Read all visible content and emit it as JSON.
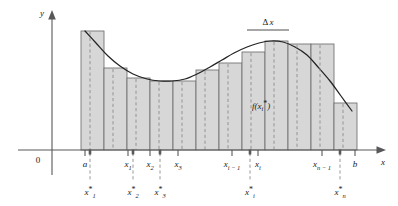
{
  "figure": {
    "axes": {
      "y_label": "y",
      "x_label": "x",
      "origin_label": "0"
    },
    "annotations": {
      "delta_x": "Δx",
      "delta_x_plain": "Δ",
      "delta_x_var": "x",
      "function_value": "f(x",
      "function_value_sub": "i",
      "function_value_star": "*",
      "function_value_close": ")"
    },
    "colors": {
      "bar_fill": "#d7d7d7",
      "bar_stroke": "#6d6d6d",
      "curve": "#232323",
      "axis": "#58585a",
      "dash": "#8c8c8c",
      "background": "#ffffff"
    },
    "partition_labels": [
      {
        "name": "a",
        "base": "a",
        "sub": "",
        "star": false,
        "x": 85
      },
      {
        "name": "x1",
        "base": "x",
        "sub": "1",
        "star": false,
        "x": 128
      },
      {
        "name": "x2",
        "base": "x",
        "sub": "2",
        "star": false,
        "x": 150
      },
      {
        "name": "x3",
        "base": "x",
        "sub": "3",
        "star": false,
        "x": 178
      },
      {
        "name": "xi-1",
        "base": "x",
        "sub": "i − 1",
        "star": false,
        "x": 232
      },
      {
        "name": "xi",
        "base": "x",
        "sub": "i",
        "star": false,
        "x": 258
      },
      {
        "name": "xn-1",
        "base": "x",
        "sub": "n − 1",
        "star": false,
        "x": 322
      },
      {
        "name": "b",
        "base": "b",
        "sub": "",
        "star": false,
        "x": 355
      }
    ],
    "sample_labels": [
      {
        "name": "x1-star",
        "base": "x",
        "sub": "1",
        "star": true,
        "x": 90
      },
      {
        "name": "x2-star",
        "base": "x",
        "sub": "2",
        "star": true,
        "x": 133
      },
      {
        "name": "x3-star",
        "base": "x",
        "sub": "3",
        "star": true,
        "x": 160
      },
      {
        "name": "xi-star",
        "base": "x",
        "sub": "i",
        "star": true,
        "x": 250
      },
      {
        "name": "xn-star",
        "base": "x",
        "sub": "n",
        "star": true,
        "x": 340
      }
    ]
  },
  "chart_data": {
    "type": "area",
    "xlabel": "x",
    "ylabel": "y",
    "grid": false,
    "legend": null,
    "xlim": [
      0,
      398
    ],
    "ylim": [
      0,
      206
    ],
    "baseline_y": 150,
    "curve_description": "Smooth function decreasing from a to a local minimum near x3, rising to a maximum near xi, then decreasing to b",
    "curve_points": [
      [
        85,
        31
      ],
      [
        96,
        43
      ],
      [
        108,
        56
      ],
      [
        120,
        66
      ],
      [
        133,
        74
      ],
      [
        147,
        79
      ],
      [
        160,
        81
      ],
      [
        172,
        81
      ],
      [
        185,
        79
      ],
      [
        197,
        74
      ],
      [
        210,
        67
      ],
      [
        222,
        60
      ],
      [
        234,
        53
      ],
      [
        247,
        47
      ],
      [
        259,
        43
      ],
      [
        271,
        41
      ],
      [
        283,
        42
      ],
      [
        295,
        47
      ],
      [
        307,
        55
      ],
      [
        318,
        67
      ],
      [
        330,
        81
      ],
      [
        341,
        96
      ],
      [
        352,
        111
      ]
    ],
    "rectangles": [
      {
        "index": 1,
        "x_left": 81,
        "x_right": 104,
        "top_y": 31,
        "height": 119
      },
      {
        "index": 2,
        "x_left": 104,
        "x_right": 127,
        "top_y": 68,
        "height": 82
      },
      {
        "index": 3,
        "x_left": 127,
        "x_right": 150,
        "top_y": 78,
        "height": 72
      },
      {
        "index": 4,
        "x_left": 150,
        "x_right": 173,
        "top_y": 81,
        "height": 69
      },
      {
        "index": 5,
        "x_left": 173,
        "x_right": 196,
        "top_y": 81,
        "height": 69
      },
      {
        "index": 6,
        "x_left": 196,
        "x_right": 219,
        "top_y": 70,
        "height": 80
      },
      {
        "index": 7,
        "x_left": 219,
        "x_right": 242,
        "top_y": 63,
        "height": 87
      },
      {
        "index": 8,
        "x_left": 242,
        "x_right": 265,
        "top_y": 52,
        "height": 98
      },
      {
        "index": 9,
        "x_left": 265,
        "x_right": 288,
        "top_y": 41,
        "height": 109
      },
      {
        "index": 10,
        "x_left": 288,
        "x_right": 311,
        "top_y": 44,
        "height": 106
      },
      {
        "index": 11,
        "x_left": 311,
        "x_right": 334,
        "top_y": 44,
        "height": 106
      },
      {
        "index": 12,
        "x_left": 334,
        "x_right": 357,
        "top_y": 103,
        "height": 47
      }
    ],
    "sample_lines_x": [
      90,
      113,
      136,
      159,
      182,
      205,
      228,
      251,
      274,
      297,
      320,
      343
    ],
    "partition_ticks_x": [
      85,
      128,
      150,
      178,
      232,
      258,
      322,
      355
    ],
    "delta_x_bracket": {
      "x_start": 247,
      "x_end": 289,
      "y": 30
    }
  }
}
